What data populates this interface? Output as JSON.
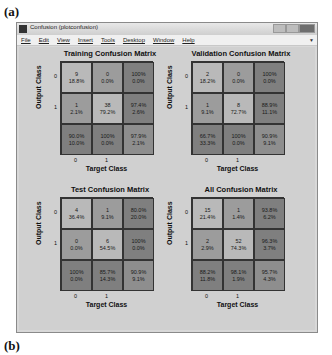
{
  "figure_labels": {
    "top": "(a)",
    "bottom": "(b)"
  },
  "window": {
    "title": "Confusion (plotconfusion)",
    "menu": [
      "File",
      "Edit",
      "View",
      "Insert",
      "Tools",
      "Desktop",
      "Window",
      "Help"
    ]
  },
  "axis": {
    "xlabel": "Target Class",
    "ylabel": "Output Class",
    "ticks": [
      "0",
      "1"
    ]
  },
  "colors": {
    "diagonal": "#b9b9b9",
    "off_diagonal": "#9c9c9c",
    "margin": "#7f7f7f",
    "total": "#8e8e8e"
  },
  "chart_data": [
    {
      "type": "heatmap",
      "title": "Training Confusion Matrix",
      "xlabel": "Target Class",
      "ylabel": "Output Class",
      "categories": [
        "0",
        "1"
      ],
      "cells": [
        [
          {
            "count": "9",
            "pct": "18.8%"
          },
          {
            "count": "0",
            "pct": "0.0%"
          },
          {
            "count": "100%",
            "pct": "0.0%"
          }
        ],
        [
          {
            "count": "1",
            "pct": "2.1%"
          },
          {
            "count": "38",
            "pct": "79.2%"
          },
          {
            "count": "97.4%",
            "pct": "2.6%"
          }
        ],
        [
          {
            "count": "90.0%",
            "pct": "10.0%"
          },
          {
            "count": "100%",
            "pct": "0.0%"
          },
          {
            "count": "97.9%",
            "pct": "2.1%"
          }
        ]
      ]
    },
    {
      "type": "heatmap",
      "title": "Validation Confusion Matrix",
      "xlabel": "Target Class",
      "ylabel": "Output Class",
      "categories": [
        "0",
        "1"
      ],
      "cells": [
        [
          {
            "count": "2",
            "pct": "18.2%"
          },
          {
            "count": "0",
            "pct": "0.0%"
          },
          {
            "count": "100%",
            "pct": "0.0%"
          }
        ],
        [
          {
            "count": "1",
            "pct": "9.1%"
          },
          {
            "count": "8",
            "pct": "72.7%"
          },
          {
            "count": "88.9%",
            "pct": "11.1%"
          }
        ],
        [
          {
            "count": "66.7%",
            "pct": "33.3%"
          },
          {
            "count": "100%",
            "pct": "0.0%"
          },
          {
            "count": "90.9%",
            "pct": "9.1%"
          }
        ]
      ]
    },
    {
      "type": "heatmap",
      "title": "Test Confusion Matrix",
      "xlabel": "Target Class",
      "ylabel": "Output Class",
      "categories": [
        "0",
        "1"
      ],
      "cells": [
        [
          {
            "count": "4",
            "pct": "36.4%"
          },
          {
            "count": "1",
            "pct": "9.1%"
          },
          {
            "count": "80.0%",
            "pct": "20.0%"
          }
        ],
        [
          {
            "count": "0",
            "pct": "0.0%"
          },
          {
            "count": "6",
            "pct": "54.5%"
          },
          {
            "count": "100%",
            "pct": "0.0%"
          }
        ],
        [
          {
            "count": "100%",
            "pct": "0.0%"
          },
          {
            "count": "85.7%",
            "pct": "14.3%"
          },
          {
            "count": "90.9%",
            "pct": "9.1%"
          }
        ]
      ]
    },
    {
      "type": "heatmap",
      "title": "All Confusion Matrix",
      "xlabel": "Target Class",
      "ylabel": "Output Class",
      "categories": [
        "0",
        "1"
      ],
      "cells": [
        [
          {
            "count": "15",
            "pct": "21.4%"
          },
          {
            "count": "1",
            "pct": "1.4%"
          },
          {
            "count": "93.8%",
            "pct": "6.2%"
          }
        ],
        [
          {
            "count": "2",
            "pct": "2.9%"
          },
          {
            "count": "52",
            "pct": "74.3%"
          },
          {
            "count": "96.3%",
            "pct": "3.7%"
          }
        ],
        [
          {
            "count": "88.2%",
            "pct": "11.8%"
          },
          {
            "count": "98.1%",
            "pct": "1.9%"
          },
          {
            "count": "95.7%",
            "pct": "4.3%"
          }
        ]
      ]
    }
  ]
}
